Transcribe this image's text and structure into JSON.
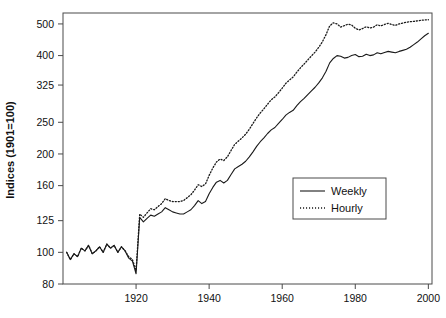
{
  "chart_data": {
    "type": "line",
    "title": "",
    "xlabel": "",
    "ylabel": "Indices (1901=100)",
    "yscale": "log",
    "ylim": [
      80,
      540
    ],
    "xlim": [
      1900,
      2001
    ],
    "grid": false,
    "legend_position": "center-right",
    "ytick_labels": [
      "80",
      "100",
      "125",
      "160",
      "200",
      "250",
      "325",
      "400",
      "500"
    ],
    "ytick_values": [
      80,
      100,
      125,
      160,
      200,
      250,
      325,
      400,
      500
    ],
    "xtick_labels": [
      "1920",
      "1940",
      "1960",
      "1980",
      "2000"
    ],
    "xtick_values": [
      1920,
      1940,
      1960,
      1980,
      2000
    ],
    "series": [
      {
        "name": "Weekly",
        "style": "solid",
        "color": "#1a1a1a",
        "x": [
          1901,
          1902,
          1903,
          1904,
          1905,
          1906,
          1907,
          1908,
          1909,
          1910,
          1911,
          1912,
          1913,
          1914,
          1915,
          1916,
          1917,
          1918,
          1919,
          1920,
          1921,
          1922,
          1923,
          1924,
          1925,
          1926,
          1927,
          1928,
          1929,
          1930,
          1931,
          1932,
          1933,
          1934,
          1935,
          1936,
          1937,
          1938,
          1939,
          1940,
          1941,
          1942,
          1943,
          1944,
          1945,
          1946,
          1947,
          1948,
          1949,
          1950,
          1951,
          1952,
          1953,
          1954,
          1955,
          1956,
          1957,
          1958,
          1959,
          1960,
          1961,
          1962,
          1963,
          1964,
          1965,
          1966,
          1967,
          1968,
          1969,
          1970,
          1971,
          1972,
          1973,
          1974,
          1975,
          1976,
          1977,
          1978,
          1979,
          1980,
          1981,
          1982,
          1983,
          1984,
          1985,
          1986,
          1987,
          1988,
          1989,
          1990,
          1991,
          1992,
          1993,
          1994,
          1995,
          1996,
          1997,
          1998,
          1999,
          2000
        ],
        "values": [
          100,
          95,
          99,
          97,
          103,
          101,
          105,
          99,
          101,
          104,
          100,
          106,
          103,
          105,
          100,
          104,
          101,
          96,
          94,
          86,
          128,
          124,
          127,
          130,
          129,
          131,
          133,
          137,
          135,
          133,
          132,
          131,
          131,
          133,
          135,
          139,
          144,
          141,
          143,
          151,
          158,
          164,
          166,
          163,
          166,
          173,
          180,
          183,
          186,
          190,
          196,
          203,
          211,
          218,
          224,
          231,
          237,
          241,
          248,
          255,
          263,
          268,
          272,
          281,
          289,
          296,
          304,
          312,
          320,
          330,
          342,
          358,
          380,
          392,
          400,
          398,
          393,
          395,
          400,
          403,
          397,
          398,
          404,
          400,
          402,
          408,
          405,
          409,
          412,
          410,
          408,
          412,
          415,
          418,
          424,
          432,
          440,
          450,
          460,
          468
        ]
      },
      {
        "name": "Hourly",
        "style": "dotted",
        "color": "#1a1a1a",
        "x": [
          1901,
          1902,
          1903,
          1904,
          1905,
          1906,
          1907,
          1908,
          1909,
          1910,
          1911,
          1912,
          1913,
          1914,
          1915,
          1916,
          1917,
          1918,
          1919,
          1920,
          1921,
          1922,
          1923,
          1924,
          1925,
          1926,
          1927,
          1928,
          1929,
          1930,
          1931,
          1932,
          1933,
          1934,
          1935,
          1936,
          1937,
          1938,
          1939,
          1940,
          1941,
          1942,
          1943,
          1944,
          1945,
          1946,
          1947,
          1948,
          1949,
          1950,
          1951,
          1952,
          1953,
          1954,
          1955,
          1956,
          1957,
          1958,
          1959,
          1960,
          1961,
          1962,
          1963,
          1964,
          1965,
          1966,
          1967,
          1968,
          1969,
          1970,
          1971,
          1972,
          1973,
          1974,
          1975,
          1976,
          1977,
          1978,
          1979,
          1980,
          1981,
          1982,
          1983,
          1984,
          1985,
          1986,
          1987,
          1988,
          1989,
          1990,
          1991,
          1992,
          1993,
          1994,
          1995,
          1996,
          1997,
          1998,
          1999,
          2000
        ],
        "values": [
          100,
          95,
          99,
          97,
          103,
          101,
          105,
          99,
          101,
          104,
          100,
          106,
          103,
          105,
          100,
          104,
          101,
          97,
          95,
          88,
          131,
          128,
          132,
          136,
          135,
          138,
          141,
          146,
          144,
          143,
          143,
          143,
          144,
          147,
          150,
          155,
          161,
          159,
          162,
          172,
          181,
          189,
          193,
          191,
          196,
          205,
          214,
          219,
          224,
          230,
          238,
          248,
          258,
          267,
          275,
          284,
          293,
          299,
          308,
          318,
          329,
          337,
          344,
          356,
          367,
          377,
          388,
          399,
          410,
          424,
          441,
          464,
          493,
          504,
          500,
          489,
          494,
          499,
          496,
          485,
          479,
          484,
          490,
          486,
          489,
          497,
          493,
          498,
          502,
          498,
          495,
          500,
          503,
          506,
          508,
          509,
          511,
          513,
          514,
          515
        ]
      }
    ]
  },
  "legend": {
    "items": [
      {
        "label": "Weekly",
        "style": "solid"
      },
      {
        "label": "Hourly",
        "style": "dotted"
      }
    ]
  },
  "axes": {
    "y_title": "Indices (1901=100)"
  }
}
